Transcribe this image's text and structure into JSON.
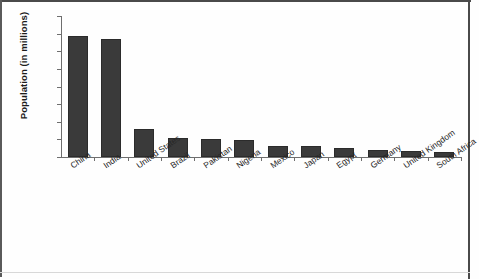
{
  "chart_data": {
    "type": "bar",
    "title": "",
    "xlabel": "",
    "ylabel": "Population (in millions)",
    "categories": [
      "China",
      "India",
      "United States",
      "Brazil",
      "Pakistan",
      "Nigeria",
      "Mexico",
      "Japan",
      "Egypt",
      "Germany",
      "United Kingdom",
      "South Africa"
    ],
    "values": [
      1375,
      1340,
      320,
      215,
      200,
      195,
      130,
      128,
      100,
      85,
      67,
      60
    ],
    "ylim": [
      0,
      1600
    ],
    "ytick_labels": [
      "0",
      "200",
      "400",
      "600",
      "800",
      "1000",
      "1200",
      "1400",
      "1600"
    ],
    "ytick_values": [
      0,
      200,
      400,
      600,
      800,
      1000,
      1200,
      1400,
      1600
    ],
    "grid": false,
    "legend": "none",
    "bar_color": "#3a3a3a",
    "axis_color": "#6e6e6e",
    "text_color": "#1c1c1c"
  }
}
